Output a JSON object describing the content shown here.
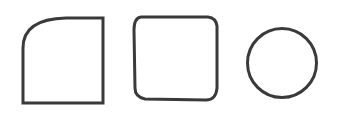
{
  "figure": {
    "background": "#ffffff",
    "stroke_color": "#3a3a3a",
    "stroke_width": 3,
    "shapes": [
      {
        "id": "shape-1",
        "kind": "square with rounded top-left corner"
      },
      {
        "id": "shape-2",
        "kind": "hand-drawn rounded square"
      },
      {
        "id": "shape-3",
        "kind": "circle"
      }
    ]
  }
}
